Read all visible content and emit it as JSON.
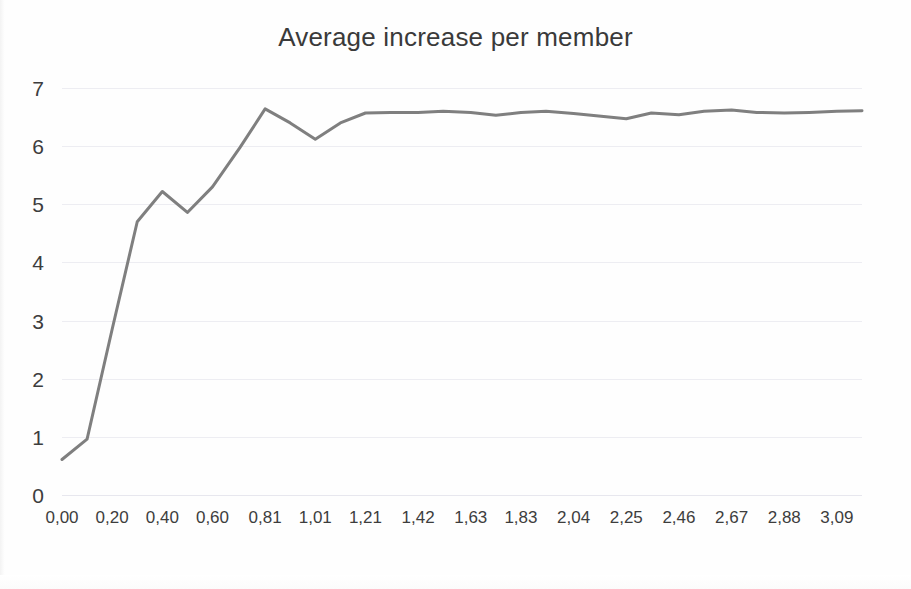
{
  "chart_data": {
    "type": "line",
    "title": "Average increase per member",
    "xlabel": "",
    "ylabel": "",
    "ylim": [
      0,
      7
    ],
    "xlim": [
      0.0,
      3.19
    ],
    "grid": true,
    "legend": null,
    "y_ticks": [
      7,
      6,
      5,
      4,
      3,
      2,
      1,
      0
    ],
    "y_tick_labels": [
      "7",
      "6",
      "5",
      "4",
      "3",
      "2",
      "1",
      "0"
    ],
    "x_tick_labels": [
      "0,00",
      "0,20",
      "0,40",
      "0,60",
      "0,81",
      "1,01",
      "1,21",
      "1,42",
      "1,63",
      "1,83",
      "2,04",
      "2,25",
      "2,46",
      "2,67",
      "2,88",
      "3,09"
    ],
    "x_tick_values": [
      0.0,
      0.2,
      0.4,
      0.6,
      0.81,
      1.01,
      1.21,
      1.42,
      1.63,
      1.83,
      2.04,
      2.25,
      2.46,
      2.67,
      2.88,
      3.09
    ],
    "line_color": "#7f7f7f",
    "line_width": 3,
    "series": [
      {
        "name": "Average increase per member",
        "x": [
          0.0,
          0.1,
          0.2,
          0.3,
          0.4,
          0.5,
          0.6,
          0.71,
          0.81,
          0.91,
          1.01,
          1.11,
          1.21,
          1.31,
          1.42,
          1.52,
          1.63,
          1.73,
          1.83,
          1.93,
          2.04,
          2.14,
          2.25,
          2.35,
          2.46,
          2.56,
          2.67,
          2.77,
          2.88,
          2.98,
          3.09,
          3.19
        ],
        "y": [
          0.61,
          0.96,
          2.85,
          4.7,
          5.22,
          4.86,
          5.3,
          5.98,
          6.64,
          6.4,
          6.12,
          6.4,
          6.57,
          6.58,
          6.58,
          6.6,
          6.58,
          6.53,
          6.58,
          6.6,
          6.56,
          6.52,
          6.47,
          6.57,
          6.54,
          6.6,
          6.62,
          6.58,
          6.57,
          6.58,
          6.6,
          6.61
        ]
      }
    ]
  }
}
